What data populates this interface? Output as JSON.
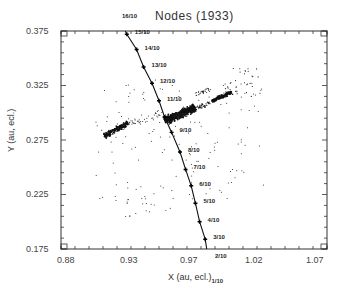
{
  "chart_data": {
    "type": "scatter",
    "title": "Nodes (1933)",
    "xlabel": "X (au, ecl.)",
    "ylabel": "Y (au, ecl.)",
    "xlim": [
      0.88,
      1.07
    ],
    "ylim": [
      0.175,
      0.375
    ],
    "x_ticks": [
      "0.88",
      "0.93",
      "0.97",
      "1.02",
      "1.07"
    ],
    "y_ticks": [
      "0.375",
      "0.325",
      "0.275",
      "0.225",
      "0.175"
    ],
    "grid": false,
    "legend": null,
    "series": [
      {
        "name": "Earth orbit (node dates)",
        "type": "line",
        "color": "#000000",
        "points": [
          {
            "label": "16/10",
            "x": 0.925,
            "y": 0.38
          },
          {
            "label": "15/10",
            "x": 0.927,
            "y": 0.372
          },
          {
            "label": "14/10",
            "x": 0.934,
            "y": 0.358
          },
          {
            "label": "13/10",
            "x": 0.939,
            "y": 0.342
          },
          {
            "label": "12/10",
            "x": 0.945,
            "y": 0.327
          },
          {
            "label": "11/10",
            "x": 0.95,
            "y": 0.311
          },
          {
            "label": "10/10",
            "x": 0.954,
            "y": 0.296
          },
          {
            "label": "9/10",
            "x": 0.959,
            "y": 0.282
          },
          {
            "label": "8/10",
            "x": 0.965,
            "y": 0.264
          },
          {
            "label": "7/10",
            "x": 0.969,
            "y": 0.248
          },
          {
            "label": "6/10",
            "x": 0.973,
            "y": 0.233
          },
          {
            "label": "5/10",
            "x": 0.976,
            "y": 0.217
          },
          {
            "label": "4/10",
            "x": 0.979,
            "y": 0.2
          },
          {
            "label": "3/10",
            "x": 0.983,
            "y": 0.184
          },
          {
            "label": "2/10",
            "x": 0.986,
            "y": 0.168
          },
          {
            "label": "1/10",
            "x": 0.989,
            "y": 0.152
          }
        ]
      },
      {
        "name": "Meteoroid nodes",
        "type": "scatter",
        "color": "#000000",
        "clusters": [
          {
            "name": "main dense cluster",
            "x_range": [
              0.952,
              0.975
            ],
            "y_range": [
              0.285,
              0.3
            ]
          },
          {
            "name": "upper-right streak",
            "x_range": [
              0.975,
              1.0
            ],
            "y_range": [
              0.3,
              0.318
            ]
          },
          {
            "name": "lower-left streak",
            "x_range": [
              0.905,
              0.93
            ],
            "y_range": [
              0.255,
              0.27
            ]
          },
          {
            "name": "upper-right sparse",
            "x_range": [
              0.99,
              1.015
            ],
            "y_range": [
              0.31,
              0.345
            ]
          }
        ]
      }
    ]
  },
  "labels": {
    "title": "Nodes (1933)",
    "xlabel": "X (au, ecl.)",
    "ylabel": "Y (au, ecl.)",
    "x_ticks": [
      "0.88",
      "0.93",
      "0.97",
      "1.02",
      "1.07"
    ],
    "y_ticks": [
      "0.375",
      "0.325",
      "0.275",
      "0.225",
      "0.175"
    ],
    "nodes": [
      "16/10",
      "15/10",
      "14/10",
      "13/10",
      "12/10",
      "11/10",
      "10/10",
      "9/10",
      "8/10",
      "7/10",
      "6/10",
      "5/10",
      "4/10",
      "3/10",
      "2/10",
      "1/10"
    ]
  }
}
